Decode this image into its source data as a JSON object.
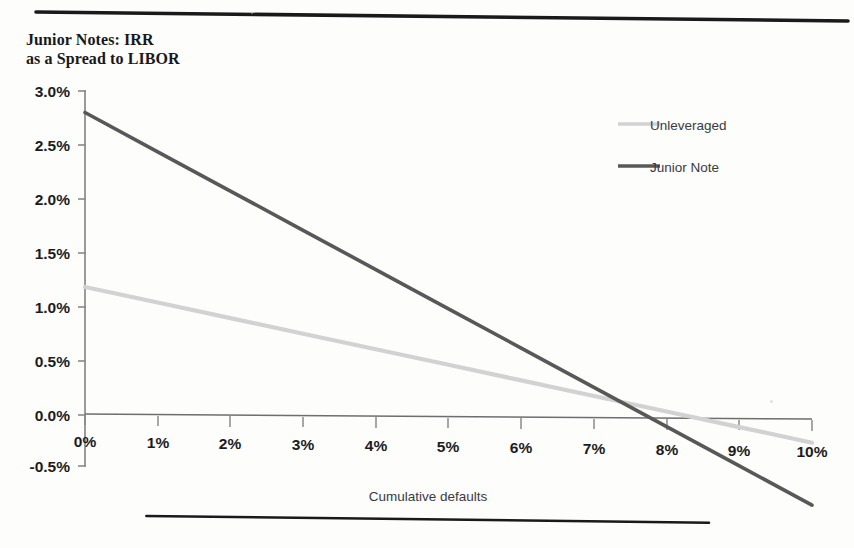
{
  "figure": {
    "top_rule": "horizontal-rule",
    "bottom_rule": "horizontal-rule"
  },
  "axes": {
    "y_ticks": [
      "3.0%",
      "2.5%",
      "2.0%",
      "1.5%",
      "1.0%",
      "0.5%",
      "0.0%",
      "-0.5%"
    ],
    "x_ticks": [
      "0%",
      "1%",
      "2%",
      "3%",
      "4%",
      "5%",
      "6%",
      "7%",
      "8%",
      "9%",
      "10%"
    ],
    "x_title": "Cumulative defaults",
    "y_title": ""
  },
  "legend": {
    "position": "top-right-inside",
    "entries": [
      {
        "label": "Unleveraged",
        "color": "#d2d2d2"
      },
      {
        "label": "Junior Note",
        "color": "#585858"
      }
    ]
  },
  "colors": {
    "unleveraged": "#d2d2d2",
    "junior_note": "#585858",
    "axis": "#8a8a8a",
    "text": "#1c1c1e",
    "rule": "#1a1a1a"
  },
  "chart_data": {
    "type": "line",
    "xlabel": "Cumulative defaults",
    "ylabel": "Junior Notes: IRR as a Spread to LIBOR",
    "xlim": [
      0,
      10
    ],
    "ylim": [
      -0.5,
      3.0
    ],
    "x_unit": "%",
    "y_unit": "%",
    "grid": false,
    "x": [
      0,
      1,
      2,
      3,
      4,
      5,
      6,
      7,
      8,
      9,
      10
    ],
    "series": [
      {
        "name": "Unleveraged",
        "color": "#d2d2d2",
        "values": [
          1.18,
          1.04,
          0.9,
          0.76,
          0.62,
          0.48,
          0.34,
          0.2,
          0.06,
          -0.08,
          -0.22
        ]
      },
      {
        "name": "Junior Note",
        "color": "#585858",
        "values": [
          2.8,
          2.44,
          2.08,
          1.72,
          1.36,
          1.0,
          0.64,
          0.28,
          -0.08,
          -0.44,
          -0.8
        ]
      }
    ],
    "annotations": [
      {
        "text": "Junior Note crosses 0.0% near 7.8% cumulative defaults"
      },
      {
        "text": "Unleveraged crosses 0.0% near 9.5% cumulative defaults"
      }
    ]
  }
}
